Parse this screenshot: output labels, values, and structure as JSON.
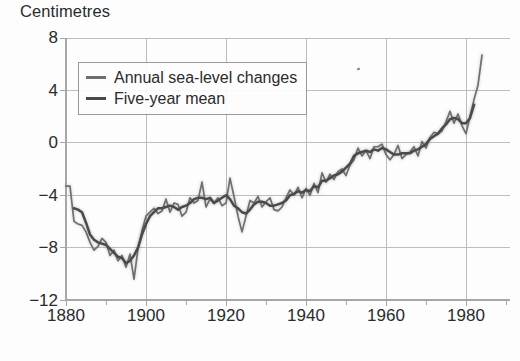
{
  "chart_data": {
    "type": "line",
    "title": "",
    "ylabel": "Centimetres",
    "xlabel": "",
    "xlim": [
      1880,
      1990
    ],
    "ylim": [
      -12,
      8
    ],
    "yticks": [
      8,
      4,
      0,
      -4,
      -8,
      -12
    ],
    "xticks": [
      1880,
      1900,
      1920,
      1940,
      1960,
      1980
    ],
    "xminor_step": 10,
    "grid": true,
    "legend_position": "upper-left",
    "colors": {
      "annual": "#6f6f6f",
      "mean": "#4a4a4a",
      "grid": "#bdbdbd",
      "axis": "#a6a6a6",
      "text": "#2b2b2b",
      "background": "#fdfdfd"
    },
    "series": [
      {
        "name": "Annual sea-level changes",
        "color": "#6f6f6f",
        "x": [
          1880,
          1881,
          1882,
          1883,
          1884,
          1885,
          1886,
          1887,
          1888,
          1889,
          1890,
          1891,
          1892,
          1893,
          1894,
          1895,
          1896,
          1897,
          1898,
          1899,
          1900,
          1901,
          1902,
          1903,
          1904,
          1905,
          1906,
          1907,
          1908,
          1909,
          1910,
          1911,
          1912,
          1913,
          1914,
          1915,
          1916,
          1917,
          1918,
          1919,
          1920,
          1921,
          1922,
          1923,
          1924,
          1925,
          1926,
          1927,
          1928,
          1929,
          1930,
          1931,
          1932,
          1933,
          1934,
          1935,
          1936,
          1937,
          1938,
          1939,
          1940,
          1941,
          1942,
          1943,
          1944,
          1945,
          1946,
          1947,
          1948,
          1949,
          1950,
          1951,
          1952,
          1953,
          1954,
          1955,
          1956,
          1957,
          1958,
          1959,
          1960,
          1961,
          1962,
          1963,
          1964,
          1965,
          1966,
          1967,
          1968,
          1969,
          1970,
          1971,
          1972,
          1973,
          1974,
          1975,
          1976,
          1977,
          1978,
          1979,
          1980,
          1981,
          1982,
          1983,
          1984
        ],
        "values": [
          -3.3,
          -3.3,
          -6.0,
          -6.2,
          -6.3,
          -6.8,
          -7.6,
          -8.2,
          -7.9,
          -7.3,
          -7.6,
          -8.6,
          -8.2,
          -9.0,
          -8.6,
          -9.5,
          -8.5,
          -10.4,
          -8.1,
          -6.7,
          -5.6,
          -5.3,
          -5.0,
          -5.4,
          -5.2,
          -4.3,
          -5.3,
          -4.6,
          -4.7,
          -5.6,
          -5.3,
          -4.2,
          -4.6,
          -4.4,
          -3.0,
          -4.9,
          -4.3,
          -4.6,
          -4.2,
          -4.8,
          -4.6,
          -2.7,
          -4.1,
          -5.6,
          -6.8,
          -5.6,
          -4.4,
          -4.6,
          -4.1,
          -4.9,
          -4.5,
          -4.2,
          -5.1,
          -5.2,
          -4.9,
          -4.2,
          -3.6,
          -4.0,
          -3.4,
          -4.2,
          -3.5,
          -4.0,
          -3.1,
          -3.8,
          -2.3,
          -3.0,
          -2.4,
          -2.8,
          -2.2,
          -2.0,
          -2.5,
          -1.7,
          -1.3,
          -0.4,
          -1.0,
          -0.6,
          -1.2,
          -0.3,
          -0.3,
          -0.1,
          -0.9,
          -1.3,
          -0.9,
          -0.2,
          -1.2,
          -0.9,
          -0.7,
          -0.3,
          -1.0,
          0.1,
          -0.4,
          0.4,
          0.8,
          0.7,
          0.9,
          1.6,
          2.4,
          1.5,
          2.2,
          1.3,
          0.7,
          2.0,
          3.3,
          4.4,
          6.7
        ]
      },
      {
        "name": "Five-year mean",
        "color": "#4a4a4a",
        "x": [
          1882,
          1883,
          1884,
          1885,
          1886,
          1887,
          1888,
          1889,
          1890,
          1891,
          1892,
          1893,
          1894,
          1895,
          1896,
          1897,
          1898,
          1899,
          1900,
          1901,
          1902,
          1903,
          1904,
          1905,
          1906,
          1907,
          1908,
          1909,
          1910,
          1911,
          1912,
          1913,
          1914,
          1915,
          1916,
          1917,
          1918,
          1919,
          1920,
          1921,
          1922,
          1923,
          1924,
          1925,
          1926,
          1927,
          1928,
          1929,
          1930,
          1931,
          1932,
          1933,
          1934,
          1935,
          1936,
          1937,
          1938,
          1939,
          1940,
          1941,
          1942,
          1943,
          1944,
          1945,
          1946,
          1947,
          1948,
          1949,
          1950,
          1951,
          1952,
          1953,
          1954,
          1955,
          1956,
          1957,
          1958,
          1959,
          1960,
          1961,
          1962,
          1963,
          1964,
          1965,
          1966,
          1967,
          1968,
          1969,
          1970,
          1971,
          1972,
          1973,
          1974,
          1975,
          1976,
          1977,
          1978,
          1979,
          1980,
          1981,
          1982
        ],
        "values": [
          -5.0,
          -5.1,
          -5.3,
          -6.1,
          -7.0,
          -7.4,
          -7.6,
          -7.7,
          -7.8,
          -8.1,
          -8.4,
          -8.7,
          -8.8,
          -9.2,
          -9.0,
          -8.6,
          -8.0,
          -7.0,
          -6.2,
          -5.6,
          -5.3,
          -5.0,
          -5.0,
          -4.9,
          -4.8,
          -4.9,
          -5.1,
          -4.9,
          -4.8,
          -4.6,
          -4.3,
          -4.2,
          -4.2,
          -4.3,
          -4.2,
          -4.6,
          -4.4,
          -4.2,
          -4.0,
          -4.3,
          -4.8,
          -5.0,
          -5.3,
          -5.4,
          -5.1,
          -4.7,
          -4.5,
          -4.5,
          -4.6,
          -4.8,
          -4.8,
          -4.7,
          -4.6,
          -4.4,
          -4.0,
          -3.9,
          -3.7,
          -3.8,
          -3.6,
          -3.7,
          -3.3,
          -3.4,
          -2.9,
          -2.9,
          -2.7,
          -2.5,
          -2.4,
          -2.2,
          -1.9,
          -1.6,
          -1.0,
          -0.8,
          -0.7,
          -0.6,
          -0.7,
          -0.5,
          -0.6,
          -0.4,
          -0.5,
          -0.7,
          -0.9,
          -0.9,
          -0.8,
          -0.8,
          -0.8,
          -0.6,
          -0.5,
          -0.3,
          -0.1,
          0.3,
          0.5,
          0.7,
          1.1,
          1.4,
          1.8,
          1.9,
          1.8,
          1.5,
          1.5,
          1.9,
          2.9
        ]
      }
    ]
  },
  "axis": {
    "ytick_labels": [
      "8",
      "4",
      "0",
      "−4",
      "−8",
      "−12"
    ],
    "xtick_labels": [
      "1880",
      "1900",
      "1920",
      "1940",
      "1960",
      "1980"
    ],
    "unit_label": "Centimetres"
  },
  "legend": {
    "items": [
      {
        "label": "Annual sea-level changes",
        "color": "#6f6f6f"
      },
      {
        "label": "Five-year mean",
        "color": "#4a4a4a"
      }
    ]
  }
}
